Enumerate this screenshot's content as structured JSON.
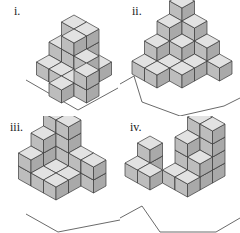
{
  "figure": {
    "colors": {
      "top": "#e2e2e2",
      "left": "#bdbdbd",
      "right": "#a9a9a9",
      "stroke": "#3a3a3a",
      "floor": "#444444"
    },
    "panels": [
      {
        "label": "i.",
        "label_pos": [
          14,
          5
        ],
        "origin": [
          74,
          48
        ],
        "floor": [
          [
            26,
            80
          ],
          [
            78,
            110
          ],
          [
            118,
            88
          ]
        ],
        "cubes": [
          [
            0,
            0,
            0
          ],
          [
            1,
            0,
            0
          ],
          [
            2,
            0,
            0
          ],
          [
            0,
            1,
            0
          ],
          [
            1,
            1,
            0
          ],
          [
            2,
            1,
            0
          ],
          [
            0,
            2,
            0
          ],
          [
            1,
            2,
            0
          ],
          [
            2,
            2,
            0
          ],
          [
            3,
            2,
            0
          ],
          [
            2,
            3,
            0
          ],
          [
            0,
            0,
            1
          ],
          [
            1,
            0,
            1
          ],
          [
            0,
            1,
            1
          ],
          [
            1,
            1,
            1
          ],
          [
            2,
            1,
            1
          ],
          [
            3,
            2,
            1
          ],
          [
            0,
            0,
            2
          ],
          [
            1,
            0,
            2
          ],
          [
            1,
            1,
            2
          ]
        ]
      },
      {
        "label": "ii.",
        "label_pos": [
          12,
          5
        ],
        "origin": [
          62,
          40
        ],
        "floor": [
          [
            0,
            84
          ],
          [
            14,
            76
          ],
          [
            22,
            102
          ],
          [
            60,
            116
          ],
          [
            104,
            106
          ],
          [
            120,
            98
          ]
        ],
        "cubes": [
          [
            0,
            0,
            0
          ],
          [
            1,
            0,
            0
          ],
          [
            2,
            0,
            0
          ],
          [
            3,
            0,
            0
          ],
          [
            0,
            1,
            0
          ],
          [
            1,
            1,
            0
          ],
          [
            2,
            1,
            0
          ],
          [
            0,
            2,
            0
          ],
          [
            1,
            2,
            0
          ],
          [
            0,
            3,
            0
          ],
          [
            2,
            2,
            0
          ],
          [
            1,
            3,
            0
          ],
          [
            0,
            0,
            1
          ],
          [
            1,
            0,
            1
          ],
          [
            2,
            0,
            1
          ],
          [
            0,
            1,
            1
          ],
          [
            1,
            1,
            1
          ],
          [
            0,
            2,
            1
          ],
          [
            0,
            0,
            2
          ],
          [
            1,
            0,
            2
          ],
          [
            0,
            1,
            2
          ],
          [
            0,
            0,
            3
          ]
        ]
      },
      {
        "label": "iii.",
        "label_pos": [
          10,
          5
        ],
        "origin": [
          56,
          36
        ],
        "floor": [
          [
            26,
            98
          ],
          [
            58,
            116
          ],
          [
            120,
            104
          ]
        ],
        "cubes": [
          [
            0,
            0,
            0
          ],
          [
            1,
            0,
            0
          ],
          [
            2,
            0,
            0
          ],
          [
            3,
            0,
            0
          ],
          [
            0,
            1,
            0
          ],
          [
            1,
            1,
            0
          ],
          [
            2,
            1,
            0
          ],
          [
            0,
            2,
            0
          ],
          [
            1,
            2,
            0
          ],
          [
            2,
            2,
            0
          ],
          [
            0,
            0,
            1
          ],
          [
            1,
            0,
            1
          ],
          [
            2,
            0,
            1
          ],
          [
            3,
            0,
            1
          ],
          [
            0,
            1,
            1
          ],
          [
            0,
            2,
            1
          ],
          [
            0,
            0,
            2
          ],
          [
            1,
            0,
            2
          ],
          [
            0,
            1,
            2
          ],
          [
            0,
            0,
            3
          ],
          [
            1,
            0,
            3
          ]
        ]
      },
      {
        "label": "iv.",
        "label_pos": [
          10,
          5
        ],
        "origin": [
          80,
          40
        ],
        "floor": [
          [
            0,
            102
          ],
          [
            22,
            90
          ],
          [
            40,
            116
          ],
          [
            96,
            116
          ],
          [
            120,
            102
          ]
        ],
        "cubes": [
          [
            0,
            0,
            0
          ],
          [
            1,
            0,
            0
          ],
          [
            0,
            1,
            0
          ],
          [
            1,
            1,
            0
          ],
          [
            0,
            2,
            0
          ],
          [
            1,
            2,
            0
          ],
          [
            -2,
            2,
            0
          ],
          [
            -2,
            3,
            0
          ],
          [
            -1,
            3,
            0
          ],
          [
            0,
            0,
            1
          ],
          [
            1,
            0,
            1
          ],
          [
            0,
            1,
            1
          ],
          [
            1,
            1,
            1
          ],
          [
            -2,
            2,
            1
          ],
          [
            0,
            0,
            2
          ],
          [
            1,
            0,
            2
          ],
          [
            0,
            1,
            2
          ],
          [
            0,
            0,
            3
          ],
          [
            1,
            0,
            3
          ]
        ]
      }
    ]
  }
}
